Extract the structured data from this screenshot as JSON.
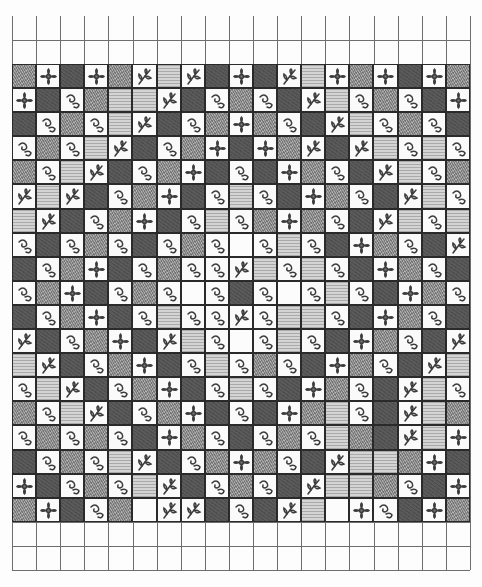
{
  "legend": {
    "D": "dark-solid-tile",
    "G": "gray-texture-tile",
    "L": "light-texture-tile",
    "F": "flower-motif-tile",
    "V": "leaf-vine-motif-tile",
    "S": "swirl-motif-tile",
    "E": "empty-tile"
  },
  "grid": {
    "columns": 19,
    "empty_rows_top": 2,
    "empty_rows_bottom": 2,
    "tile_rows": [
      "GFDFGVLVDFDVLFGFDFG",
      "FDSGLLVDSGSDVLSGSDF",
      "DSGSLVDSGFGSDVLSGSD",
      "SGSLVDSGFDFGVDVLSLS",
      "GSLVDSGFDSDFGSDVLSG",
      "VLVDSGFDSLSDFGSDVLS",
      "LVDSGFDSLSGFGSDVLSL",
      "SDSGSDSGSESLSDFGSDV",
      "DSGFDSGSSVLSLSDFGSD",
      "SGFDSGSESDSESLSDFGS",
      "DSGFDSLSSVSLLSDFGSD",
      "VDSGFDVLSESLSDFGSDV",
      "LVDSGFDSLSGSDFGSDVL",
      "SLVDSGFDSLSDFGSDVLS",
      "GSLVDSGFDSDFGLSDVLG",
      "SGSGSDFGSDSGSLGDVLF",
      "DSGSLVDSGFGSDVLLGFD",
      "FDSGSLVDSGSDVLLGSDF",
      "GFDSGEVVDSDVLEFSDFG"
    ]
  }
}
